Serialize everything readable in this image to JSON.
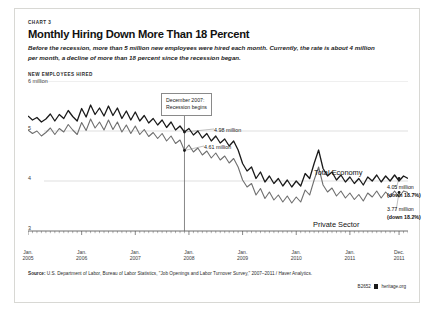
{
  "card": {
    "chart_number": "CHART 3",
    "title": "Monthly Hiring Down More Than 18 Percent",
    "subtitle": "Before the recession, more than 5 million new employees were hired each month. Currently, the rate is about 4 million per month, a decline of more than 18 percent since the recession began.",
    "yaxis_title": "NEW EMPLOYEES HIRED"
  },
  "annotations": {
    "recession_line_1": "December 2007:",
    "recession_line_2": "Recession begins",
    "value_total_at_recession": "4.98 million",
    "value_private_at_recession": "4.61 million",
    "series_label_total": "Total Economy",
    "series_label_private": "Private Sector",
    "end_total_value": "4.05 million",
    "end_total_change": "(down 18.7%)",
    "end_private_value": "3.77 million",
    "end_private_change": "(down 18.2%)"
  },
  "footer": {
    "source_label": "Source:",
    "source_text": "U.S. Department of Labor, Bureau of Labor Statistics, \"Job Openings and Labor Turnover Survey,\" 2007–2011 / Haver Analytics.",
    "chart_id": "B2652",
    "site": "heritage.org"
  },
  "chart_data": {
    "type": "line",
    "title": "Monthly Hiring Down More Than 18 Percent",
    "subtitle": "Before the recession, more than 5 million new employees were hired each month. Currently, the rate is about 4 million per month, a decline of more than 18 percent since the recession began.",
    "xlabel": "",
    "ylabel": "NEW EMPLOYEES HIRED",
    "ylim": [
      3,
      6
    ],
    "yticks": [
      3,
      4,
      5,
      6
    ],
    "ytick_labels": [
      "3",
      "4",
      "5",
      "6 million"
    ],
    "grid": "horizontal",
    "legend": "inline-labels",
    "x_start": "2005-01",
    "x_end": "2011-12",
    "xtick_positions": [
      0,
      12,
      24,
      36,
      48,
      60,
      72,
      83
    ],
    "xtick_labels": [
      {
        "line1": "Jan.",
        "line2": "2005"
      },
      {
        "line1": "Jan.",
        "line2": "2006"
      },
      {
        "line1": "Jan.",
        "line2": "2007"
      },
      {
        "line1": "Jan.",
        "line2": "2008"
      },
      {
        "line1": "Jan.",
        "line2": "2009"
      },
      {
        "line1": "Jan.",
        "line2": "2010"
      },
      {
        "line1": "Jan.",
        "line2": "2011"
      },
      {
        "line1": "Dec.",
        "line2": "2011"
      }
    ],
    "recession_marker": {
      "index": 35,
      "label": "December 2007: Recession begins"
    },
    "annotated_points": [
      {
        "series": "Total Economy",
        "index": 35,
        "value": 4.98,
        "label": "4.98 million"
      },
      {
        "series": "Private Sector",
        "index": 35,
        "value": 4.61,
        "label": "4.61 million"
      },
      {
        "series": "Total Economy",
        "index": 83,
        "value": 4.05,
        "label": "4.05 million",
        "change": "(down 18.7%)"
      },
      {
        "series": "Private Sector",
        "index": 83,
        "value": 3.77,
        "label": "3.77 million",
        "change": "(down 18.2%)"
      }
    ],
    "series": [
      {
        "name": "Total Economy",
        "color": "#1a1a1a",
        "values": [
          5.3,
          5.22,
          5.27,
          5.18,
          5.24,
          5.34,
          5.2,
          5.33,
          5.25,
          5.41,
          5.29,
          5.2,
          5.45,
          5.28,
          5.52,
          5.33,
          5.46,
          5.3,
          5.5,
          5.31,
          5.46,
          5.25,
          5.4,
          5.22,
          5.38,
          5.2,
          5.31,
          5.16,
          5.25,
          5.12,
          5.22,
          5.07,
          5.18,
          5.02,
          5.1,
          4.98,
          5.05,
          4.92,
          5.0,
          4.86,
          4.95,
          4.8,
          4.9,
          4.76,
          4.84,
          4.7,
          4.8,
          4.62,
          4.35,
          4.2,
          4.28,
          4.05,
          4.18,
          3.98,
          4.1,
          3.95,
          4.05,
          3.9,
          4.02,
          3.88,
          4.0,
          3.9,
          4.15,
          4.05,
          4.35,
          4.62,
          4.25,
          4.1,
          4.18,
          4.02,
          4.12,
          3.98,
          4.08,
          3.95,
          4.05,
          3.92,
          4.08,
          4.0,
          4.12,
          3.98,
          4.1,
          4.0,
          4.12,
          4.0,
          4.1,
          4.05
        ]
      },
      {
        "name": "Private Sector",
        "color": "#6f6f6f",
        "values": [
          5.02,
          4.95,
          5.0,
          4.9,
          4.97,
          5.06,
          4.93,
          5.05,
          4.98,
          5.13,
          5.02,
          4.93,
          5.17,
          5.01,
          5.24,
          5.06,
          5.18,
          5.02,
          5.22,
          5.03,
          5.18,
          4.98,
          5.12,
          4.95,
          5.1,
          4.93,
          5.03,
          4.89,
          4.97,
          4.85,
          4.95,
          4.8,
          4.9,
          4.75,
          4.82,
          4.61,
          4.72,
          4.58,
          4.66,
          4.52,
          4.6,
          4.46,
          4.56,
          4.42,
          4.5,
          4.36,
          4.45,
          4.28,
          4.02,
          3.88,
          3.95,
          3.72,
          3.85,
          3.65,
          3.78,
          3.62,
          3.72,
          3.58,
          3.7,
          3.56,
          3.68,
          3.58,
          3.82,
          3.72,
          4.02,
          4.28,
          3.92,
          3.78,
          3.86,
          3.7,
          3.8,
          3.66,
          3.76,
          3.63,
          3.73,
          3.6,
          3.76,
          3.68,
          3.8,
          3.66,
          3.78,
          3.68,
          3.8,
          3.68,
          3.8,
          3.77
        ]
      }
    ]
  }
}
